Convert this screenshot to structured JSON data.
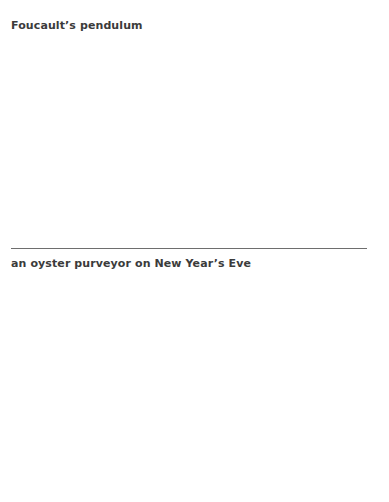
{
  "card": {
    "top_text": "Foucault’s pendulum",
    "bottom_text": "an oyster purveyor on New Year’s Eve"
  }
}
